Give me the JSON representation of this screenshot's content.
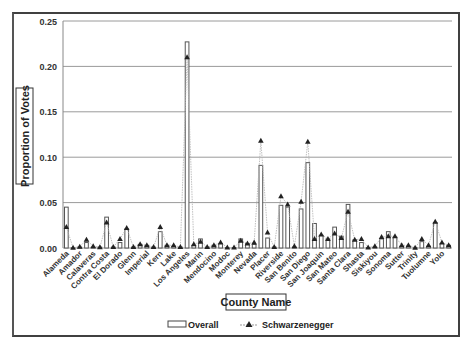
{
  "chart_data": {
    "type": "bar",
    "title": "",
    "xlabel": "County Name",
    "ylabel": "Proportion of Votes",
    "ylim": [
      0,
      0.25
    ],
    "yticks": [
      "0.00",
      "0.05",
      "0.10",
      "0.15",
      "0.20",
      "0.25"
    ],
    "grid": true,
    "legend_position": "bottom",
    "categories": [
      "Alameda",
      "Alpine",
      "Amador",
      "Butte",
      "Calaveras",
      "Colusa",
      "Contra Costa",
      "Del Norte",
      "El Dorado",
      "Fresno",
      "Glenn",
      "Humboldt",
      "Imperial",
      "Inyo",
      "Kern",
      "Kings",
      "Lake",
      "Lassen",
      "Los Angeles",
      "Madera",
      "Marin",
      "Mariposa",
      "Mendocino",
      "Merced",
      "Modoc",
      "Mono",
      "Monterey",
      "Napa",
      "Nevada",
      "Orange",
      "Placer",
      "Plumas",
      "Riverside",
      "Sacramento",
      "San Benito",
      "San Bernardino",
      "San Diego",
      "San Francisco",
      "San Joaquin",
      "San Luis Obispo",
      "San Mateo",
      "Santa Barbara",
      "Santa Clara",
      "Santa Cruz",
      "Shasta",
      "Sierra",
      "Siskiyou",
      "Solano",
      "Sonoma",
      "Stanislaus",
      "Sutter",
      "Tehama",
      "Trinity",
      "Tulare",
      "Tuolumne",
      "Ventura",
      "Yolo",
      "Yuba"
    ],
    "tick_labels": [
      "Alameda",
      "Amador",
      "Calaveras",
      "Contra Costa",
      "El Dorado",
      "Glenn",
      "Imperial",
      "Kern",
      "Lake",
      "Los Angeles",
      "Marin",
      "Mendocino",
      "Modoc",
      "Monterey",
      "Nevada",
      "Placer",
      "Riverside",
      "San Benito",
      "San Diego",
      "San Joaquin",
      "San Mateo",
      "Santa Clara",
      "Shasta",
      "Siskiyou",
      "Sonoma",
      "Sutter",
      "Trinity",
      "Tuolumne",
      "Yolo"
    ],
    "series": [
      {
        "name": "Overall",
        "style": "bar",
        "values": [
          0.045,
          0.0002,
          0.001,
          0.006,
          0.001,
          0.001,
          0.034,
          0.001,
          0.006,
          0.021,
          0.001,
          0.004,
          0.003,
          0.001,
          0.018,
          0.003,
          0.002,
          0.001,
          0.227,
          0.003,
          0.01,
          0.001,
          0.003,
          0.005,
          0.0005,
          0.0005,
          0.01,
          0.005,
          0.004,
          0.091,
          0.011,
          0.001,
          0.047,
          0.045,
          0.001,
          0.043,
          0.094,
          0.027,
          0.014,
          0.01,
          0.023,
          0.013,
          0.048,
          0.009,
          0.006,
          0.0005,
          0.001,
          0.01,
          0.018,
          0.012,
          0.002,
          0.002,
          0.0003,
          0.007,
          0.002,
          0.028,
          0.005,
          0.003
        ]
      },
      {
        "name": "Schwarzenegger",
        "style": "line-triangle",
        "values": [
          0.023,
          0.0003,
          0.0015,
          0.009,
          0.002,
          0.0008,
          0.028,
          0.001,
          0.01,
          0.022,
          0.001,
          0.004,
          0.003,
          0.001,
          0.023,
          0.003,
          0.003,
          0.001,
          0.21,
          0.004,
          0.007,
          0.001,
          0.003,
          0.006,
          0.0006,
          0.0005,
          0.008,
          0.005,
          0.006,
          0.118,
          0.017,
          0.001,
          0.057,
          0.048,
          0.002,
          0.051,
          0.117,
          0.01,
          0.015,
          0.01,
          0.016,
          0.011,
          0.04,
          0.009,
          0.01,
          0.0006,
          0.002,
          0.012,
          0.013,
          0.013,
          0.003,
          0.003,
          0.0004,
          0.01,
          0.003,
          0.029,
          0.006,
          0.003
        ]
      }
    ]
  },
  "legend": {
    "items": [
      {
        "label": "Overall",
        "symbol": "bar"
      },
      {
        "label": "Schwarzenegger",
        "symbol": "line-triangle"
      }
    ]
  },
  "colors": {
    "bar_fill": "#ffffff",
    "bar_stroke": "#555555",
    "line": "#b0b0b0",
    "marker": "#222222",
    "grid": "#9a9a9a",
    "frame": "#404040"
  }
}
